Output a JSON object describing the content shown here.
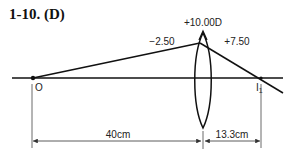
{
  "title": "1-10. (D)",
  "lens": {
    "power_label": "+10.00D",
    "incident_vergence_label": "−2.50",
    "emergent_vergence_label": "+7.50"
  },
  "points": {
    "object_label": "O",
    "image_label": "I",
    "image_subscript": "1"
  },
  "dimensions": {
    "object_distance": "40cm",
    "image_distance": "13.3cm"
  },
  "colors": {
    "line": "#111111",
    "thin_line": "#444444",
    "background": "#ffffff"
  }
}
